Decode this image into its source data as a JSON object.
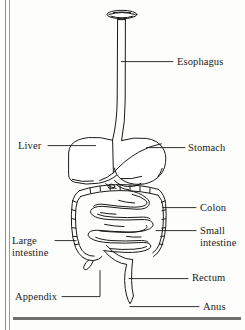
{
  "figure": {
    "style": "black line-art illustration on scanned book page",
    "ink_color": "#1a1a1a",
    "paper_color": "#fdfdfb"
  },
  "labels": {
    "esophagus": "Esophagus",
    "liver": "Liver",
    "stomach": "Stomach",
    "colon": "Colon",
    "small_intestine_line1": "Small",
    "small_intestine_line2": "intestine",
    "large_intestine_line1": "Large",
    "large_intestine_line2": "intestine",
    "appendix": "Appendix",
    "rectum": "Rectum",
    "anus": "Anus"
  },
  "organs": [
    "mouth",
    "esophagus",
    "liver",
    "stomach",
    "colon",
    "small intestine",
    "large intestine",
    "appendix",
    "rectum",
    "anus"
  ]
}
